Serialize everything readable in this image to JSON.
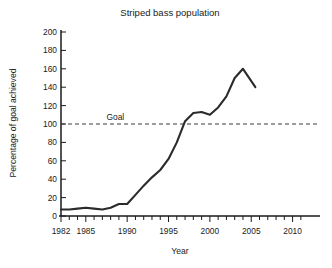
{
  "chart_data": {
    "type": "line",
    "title": "Striped bass population",
    "xlabel": "Year",
    "ylabel": "Percentage of goal achieved",
    "xlim": [
      1982,
      2011.5
    ],
    "ylim": [
      0,
      200
    ],
    "grid": false,
    "legend": null,
    "x_ticks_major": [
      1982,
      1985,
      1990,
      1995,
      2000,
      2005,
      2010
    ],
    "x_tick_labels": [
      "1982",
      "1985",
      "1990",
      "1995",
      "2000",
      "2005",
      "2010"
    ],
    "x_ticks_minor_step": 1,
    "y_ticks": [
      0,
      20,
      40,
      60,
      80,
      100,
      120,
      140,
      160,
      180,
      200
    ],
    "y_tick_labels": [
      "0",
      "20",
      "40",
      "60",
      "80",
      "100",
      "120",
      "140",
      "160",
      "180",
      "200"
    ],
    "annotations": [
      {
        "name": "goal-reference-line",
        "label": "Goal",
        "type": "horizontal-line",
        "value": 100,
        "style": "dashed",
        "label_x": 1987.5
      }
    ],
    "series": [
      {
        "name": "Striped bass population",
        "x": [
          1982,
          1983,
          1984,
          1985,
          1986,
          1987,
          1988,
          1989,
          1990,
          1991,
          1992,
          1993,
          1994,
          1995,
          1996,
          1997,
          1998,
          1999,
          2000,
          2001,
          2002,
          2003,
          2004,
          2005.5
        ],
        "values": [
          7,
          7,
          8,
          9,
          8,
          7,
          9,
          13,
          13,
          23,
          33,
          42,
          50,
          62,
          80,
          103,
          112,
          113,
          110,
          118,
          130,
          150,
          160,
          140
        ]
      }
    ]
  },
  "figure": {
    "background_color": "#ffffff",
    "line_color": "#2b2b2b",
    "axis_color": "#1a1a1a",
    "goal_line_color": "#3a3a3a"
  }
}
